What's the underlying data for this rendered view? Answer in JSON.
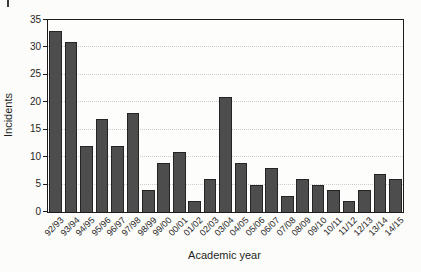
{
  "figure": {
    "background": "#fcfcfa",
    "page_corner_mark": true
  },
  "chart_data": {
    "type": "bar",
    "title": "",
    "xlabel": "Academic year",
    "ylabel": "Incidents",
    "categories": [
      "92/93",
      "93/94",
      "94/95",
      "95/96",
      "96/97",
      "97/98",
      "98/99",
      "99/00",
      "00/01",
      "01/02",
      "02/03",
      "03/04",
      "04/05",
      "05/06",
      "06/07",
      "07/08",
      "08/09",
      "09/10",
      "10/11",
      "11/12",
      "12/13",
      "13/14",
      "14/15"
    ],
    "values": [
      33,
      31,
      12,
      17,
      12,
      18,
      4,
      9,
      11,
      2,
      6,
      21,
      9,
      5,
      8,
      3,
      6,
      5,
      4,
      2,
      4,
      7,
      6
    ],
    "ylim": [
      0,
      35
    ],
    "yticks": [
      0,
      5,
      10,
      15,
      20,
      25,
      30,
      35
    ],
    "grid": "horizontal-dotted",
    "legend": "none",
    "bar_color": "#4d4d4d",
    "bar_border_color": "#242424",
    "axis_color": "#1c1c1c",
    "grid_color": "#cfcfcb",
    "xtick_rotation_deg": 45
  }
}
